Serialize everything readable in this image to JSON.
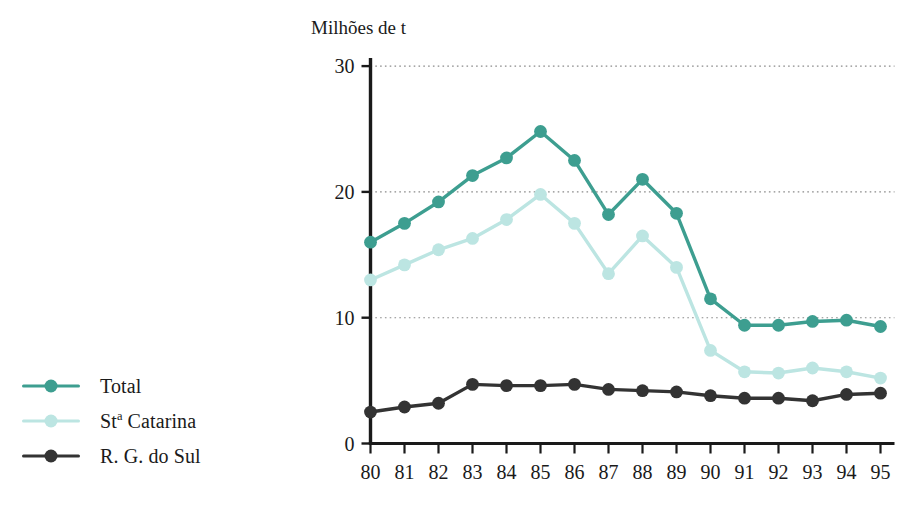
{
  "chart_data": {
    "type": "line",
    "title": "",
    "ylabel": "Milhões de t",
    "xlabel": "",
    "ylim": [
      0,
      30
    ],
    "yticks": [
      0,
      10,
      20,
      30
    ],
    "grid": true,
    "legend_position": "left",
    "categories": [
      "80",
      "81",
      "82",
      "83",
      "84",
      "85",
      "86",
      "87",
      "88",
      "89",
      "90",
      "91",
      "92",
      "93",
      "94",
      "95"
    ],
    "series": [
      {
        "name": "Total",
        "color": "#3d9e90",
        "values": [
          16.0,
          17.5,
          19.2,
          21.3,
          22.7,
          24.8,
          22.5,
          18.2,
          21.0,
          18.3,
          11.5,
          9.4,
          9.4,
          9.7,
          9.8,
          9.3
        ]
      },
      {
        "name": "Stª Catarina",
        "color": "#bce5e2",
        "values": [
          13.0,
          14.2,
          15.4,
          16.3,
          17.8,
          19.8,
          17.5,
          13.5,
          16.5,
          14.0,
          7.4,
          5.7,
          5.6,
          6.0,
          5.7,
          5.2
        ]
      },
      {
        "name": "R. G. do Sul",
        "color": "#333333",
        "values": [
          2.5,
          2.9,
          3.2,
          4.7,
          4.6,
          4.6,
          4.7,
          4.3,
          4.2,
          4.1,
          3.8,
          3.6,
          3.6,
          3.4,
          3.9,
          4.0
        ]
      }
    ]
  },
  "legend": {
    "items": [
      {
        "label_html": "Total",
        "color": "#3d9e90"
      },
      {
        "label_html": "St<sup>a</sup> Catarina",
        "color": "#bce5e2"
      },
      {
        "label_html": "R. G. do Sul",
        "color": "#333333"
      }
    ]
  },
  "axis": {
    "y_title": "Milhões de t",
    "y_labels": [
      "30",
      "20",
      "10",
      "0"
    ],
    "x_labels": [
      "80",
      "81",
      "82",
      "83",
      "84",
      "85",
      "86",
      "87",
      "88",
      "89",
      "90",
      "91",
      "92",
      "93",
      "94",
      "95"
    ]
  },
  "colors": {
    "total": "#3d9e90",
    "santa_catarina": "#bce5e2",
    "rio_grande_do_sul": "#333333",
    "axis": "#1a1a1a",
    "grid": "#8a8a8a",
    "background": "#ffffff"
  }
}
